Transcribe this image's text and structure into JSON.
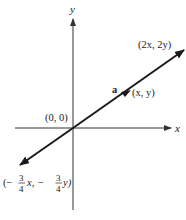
{
  "diagram": {
    "axes": {
      "x_label": "x",
      "y_label": "y"
    },
    "points": {
      "origin": "(0, 0)",
      "a_point": "(x, y)",
      "double": "(2x, 2y)",
      "neg_frac": {
        "open": "(−",
        "num1": "3",
        "den1": "4",
        "mid": "x, −",
        "num2": "3",
        "den2": "4",
        "close": "y)"
      }
    },
    "vector_label": "a",
    "colors": {
      "line": "#1a1a1a",
      "axis": "#333333",
      "text": "#222222"
    }
  }
}
